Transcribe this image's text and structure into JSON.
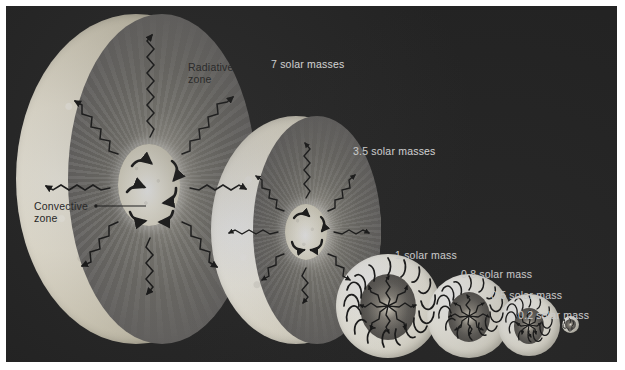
{
  "figure": {
    "kind": "stellar-interior-structure-diagram",
    "background_color": "#232323",
    "border_color": "#ffffff",
    "label_color": "#e9e9e9",
    "dark_label_color": "#232323"
  },
  "zone_labels": {
    "radiative": "Radiative\nzone",
    "radiative_line1": "Radiative",
    "radiative_line2": "zone",
    "convective_line1": "Convective",
    "convective_line2": "zone"
  },
  "stars": [
    {
      "id": "star-7",
      "label": "7 solar masses",
      "mass": 7,
      "core": "convective",
      "envelope": "radiative"
    },
    {
      "id": "star-3p5",
      "label": "3.5 solar masses",
      "mass": 3.5,
      "core": "convective",
      "envelope": "radiative"
    },
    {
      "id": "star-1",
      "label": "1 solar mass",
      "mass": 1,
      "core": "radiative",
      "envelope": "convective"
    },
    {
      "id": "star-0p8",
      "label": "0.8 solar mass",
      "mass": 0.8,
      "core": "radiative",
      "envelope": "convective"
    },
    {
      "id": "star-0p5",
      "label": "0.5 solar mass",
      "mass": 0.5,
      "core": "radiative",
      "envelope": "convective"
    },
    {
      "id": "star-0p2",
      "label": "0.2 solar mass",
      "mass": 0.2,
      "core": "none",
      "envelope": "fully convective"
    }
  ]
}
